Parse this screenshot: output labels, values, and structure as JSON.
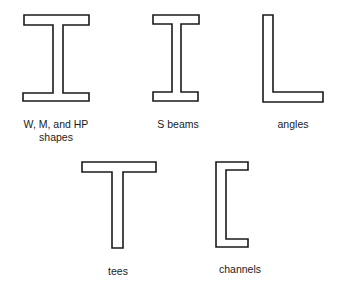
{
  "shapes": [
    {
      "id": "w-shape",
      "label_lines": [
        "W, M, and HP",
        "shapes"
      ],
      "profile": "I (wide flange)"
    },
    {
      "id": "s-beam",
      "label_lines": [
        "S beams"
      ],
      "profile": "I (narrow flange)"
    },
    {
      "id": "angle",
      "label_lines": [
        "angles"
      ],
      "profile": "L"
    },
    {
      "id": "tee",
      "label_lines": [
        "tees"
      ],
      "profile": "T"
    },
    {
      "id": "channel",
      "label_lines": [
        "channels"
      ],
      "profile": "C"
    }
  ],
  "colors": {
    "stroke": "#1a1a1a",
    "background": "#ffffff"
  }
}
